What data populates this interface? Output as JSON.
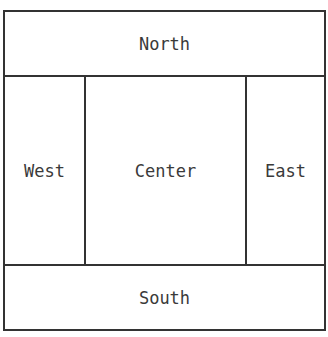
{
  "diagram": {
    "regions": {
      "north": "North",
      "west": "West",
      "center": "Center",
      "east": "East",
      "south": "South"
    },
    "colors": {
      "border": "#333333",
      "text": "#3a3a3a",
      "background": "#ffffff"
    }
  }
}
